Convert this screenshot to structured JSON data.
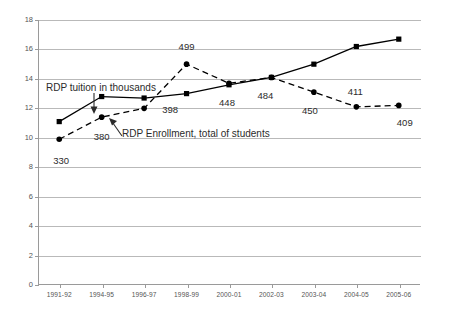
{
  "chart_data": {
    "type": "line",
    "title": "",
    "xlabel": "",
    "ylabel": "",
    "ylim": [
      0,
      18
    ],
    "yticks": [
      0,
      2,
      4,
      6,
      8,
      10,
      12,
      14,
      16,
      18
    ],
    "grid": true,
    "legend": "annotations",
    "categories": [
      "1991-92",
      "1994-95",
      "1996-97",
      "1998-99",
      "2000-01",
      "2002-03",
      "2003-04",
      "2004-05",
      "2005-06"
    ],
    "series": [
      {
        "name": "RDP tuition in thousands",
        "style": "solid",
        "marker": "square",
        "color": "#000000",
        "values": [
          11.1,
          12.8,
          12.7,
          13.0,
          13.6,
          14.1,
          15.0,
          16.2,
          16.7
        ]
      },
      {
        "name": "RDP Enrollment, total of students",
        "style": "dashed",
        "marker": "circle",
        "color": "#000000",
        "values": [
          9.9,
          11.4,
          12.0,
          15.0,
          13.7,
          14.1,
          13.1,
          12.1,
          12.2
        ],
        "data_labels": [
          "330",
          "380",
          "398",
          "499",
          "448",
          "484",
          "450",
          "411",
          "409"
        ]
      }
    ],
    "annotations": [
      {
        "text": "RDP tuition in thousands",
        "arrow": "down"
      },
      {
        "text": "RDP Enrollment, total of students",
        "arrow": "up-left"
      }
    ]
  }
}
